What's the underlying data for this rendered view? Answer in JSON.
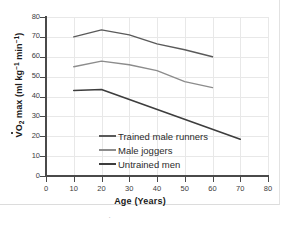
{
  "figure": {
    "background": "#ffffff",
    "border_color": "#e2e2e2",
    "below_mark": "˙"
  },
  "chart_data": {
    "type": "line",
    "title": "",
    "xlabel": "Age (Years)",
    "ylabel": "V̇O2 max (ml kg-1 min-1)",
    "ylabel_parts": {
      "v": "V",
      "o": "O",
      "sub2": "2",
      "max": " max (ml kg",
      "sup1": "−1",
      "mid": " min",
      "sup2": "−1",
      "close": ")"
    },
    "xlim": [
      0,
      80
    ],
    "ylim": [
      0,
      80
    ],
    "xticks": [
      0,
      10,
      20,
      30,
      40,
      50,
      60,
      70,
      80
    ],
    "yticks": [
      0,
      10,
      20,
      30,
      40,
      50,
      60,
      70,
      80
    ],
    "xtick_labels": [
      "0",
      "10",
      "20",
      "30",
      "40",
      "50",
      "60",
      "70",
      "80"
    ],
    "ytick_labels": [
      "0",
      "10",
      "20",
      "30",
      "40",
      "50",
      "60",
      "70",
      "80"
    ],
    "grid": true,
    "grid_color": "#e8e8e8",
    "axis_color": "#4a4a4a",
    "legend_position": "inside-lower-left",
    "series": [
      {
        "name": "Trained male runners",
        "color": "#5a5a5a",
        "width": 1.4,
        "x": [
          10,
          20,
          30,
          40,
          50,
          60
        ],
        "values": [
          70.0,
          73.5,
          71.0,
          66.5,
          63.5,
          60.0
        ]
      },
      {
        "name": "Male joggers",
        "color": "#8c8c8c",
        "width": 1.4,
        "x": [
          10,
          20,
          30,
          40,
          50,
          60
        ],
        "values": [
          55.0,
          57.8,
          56.0,
          53.0,
          47.5,
          44.5
        ]
      },
      {
        "name": "Untrained men",
        "color": "#3d3d3d",
        "width": 1.6,
        "x": [
          10,
          20,
          70
        ],
        "values": [
          43.0,
          43.5,
          18.5
        ]
      }
    ]
  }
}
